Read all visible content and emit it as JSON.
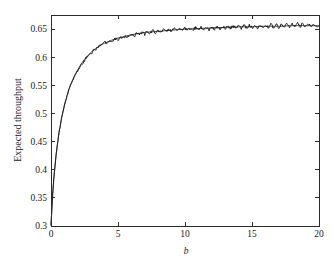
{
  "figure": {
    "background_color": "#ffffff",
    "axis_color": "#2b2b2b",
    "curve_color": "#111111"
  },
  "chart_data": {
    "type": "line",
    "title": "",
    "subtitle": "",
    "xlabel": "b",
    "ylabel": "Expected throughput",
    "xlim": [
      0,
      20
    ],
    "ylim": [
      0.3,
      0.675
    ],
    "grid": false,
    "legend": null,
    "legend_position": "none",
    "xticks": [
      0,
      5,
      10,
      15,
      20
    ],
    "xtick_labels": [
      "0",
      "5",
      "10",
      "15",
      "20"
    ],
    "yticks": [
      0.3,
      0.35,
      0.4,
      0.45,
      0.5,
      0.55,
      0.6,
      0.65
    ],
    "ytick_labels": [
      "0.3",
      "0.35",
      "0.4",
      "0.45",
      "0.5",
      "0.55",
      "0.6",
      "0.65"
    ],
    "annotations": [],
    "series": [
      {
        "name": "analytical",
        "style": "smooth-line",
        "x": [
          0,
          0.1,
          0.2,
          0.3,
          0.4,
          0.5,
          0.6,
          0.7,
          0.8,
          0.9,
          1.0,
          1.2,
          1.4,
          1.6,
          1.8,
          2.0,
          2.25,
          2.5,
          2.75,
          3.0,
          3.25,
          3.5,
          3.75,
          4.0,
          4.5,
          5.0,
          5.5,
          6.0,
          6.5,
          7.0,
          7.5,
          8.0,
          9.0,
          10.0,
          11.0,
          12.0,
          13.0,
          14.0,
          15.0,
          16.0,
          17.0,
          18.0,
          19.0,
          20.0
        ],
        "y": [
          0.301,
          0.347,
          0.381,
          0.408,
          0.43,
          0.449,
          0.466,
          0.48,
          0.493,
          0.504,
          0.514,
          0.532,
          0.547,
          0.559,
          0.569,
          0.578,
          0.588,
          0.596,
          0.603,
          0.609,
          0.614,
          0.618,
          0.622,
          0.625,
          0.63,
          0.634,
          0.637,
          0.64,
          0.642,
          0.644,
          0.645,
          0.646,
          0.648,
          0.65,
          0.651,
          0.652,
          0.653,
          0.654,
          0.654,
          0.655,
          0.655,
          0.656,
          0.656,
          0.656
        ]
      },
      {
        "name": "simulation",
        "style": "noisy-line",
        "x": [
          0,
          0.1,
          0.2,
          0.3,
          0.4,
          0.5,
          0.6,
          0.7,
          0.8,
          0.9,
          1.0,
          1.2,
          1.4,
          1.6,
          1.8,
          2.0,
          2.2,
          2.4,
          2.6,
          2.8,
          3.0,
          3.2,
          3.4,
          3.6,
          3.8,
          4.0,
          4.2,
          4.4,
          4.6,
          4.8,
          5.0,
          5.2,
          5.4,
          5.6,
          5.8,
          6.0,
          6.2,
          6.4,
          6.6,
          6.8,
          7.0,
          7.2,
          7.4,
          7.6,
          7.8,
          8.0,
          8.2,
          8.4,
          8.6,
          8.8,
          9.0,
          9.2,
          9.4,
          9.6,
          9.8,
          10.0,
          10.2,
          10.4,
          10.6,
          10.8,
          11.0,
          11.2,
          11.4,
          11.6,
          11.8,
          12.0,
          12.2,
          12.4,
          12.6,
          12.8,
          13.0,
          13.2,
          13.4,
          13.6,
          13.8,
          14.0,
          14.2,
          14.4,
          14.6,
          14.8,
          15.0,
          15.2,
          15.4,
          15.6,
          15.8,
          16.0,
          16.2,
          16.4,
          16.6,
          16.8,
          17.0,
          17.2,
          17.4,
          17.6,
          17.8,
          18.0,
          18.2,
          18.4,
          18.6,
          18.8,
          19.0,
          19.2,
          19.4,
          19.6,
          19.8,
          20.0
        ],
        "y": [
          0.302,
          0.346,
          0.382,
          0.407,
          0.431,
          0.448,
          0.467,
          0.479,
          0.494,
          0.503,
          0.515,
          0.531,
          0.548,
          0.558,
          0.57,
          0.576,
          0.585,
          0.59,
          0.598,
          0.604,
          0.607,
          0.613,
          0.615,
          0.62,
          0.621,
          0.626,
          0.625,
          0.629,
          0.628,
          0.633,
          0.631,
          0.635,
          0.633,
          0.638,
          0.635,
          0.641,
          0.637,
          0.643,
          0.639,
          0.644,
          0.641,
          0.646,
          0.642,
          0.647,
          0.643,
          0.648,
          0.644,
          0.649,
          0.645,
          0.65,
          0.646,
          0.651,
          0.647,
          0.651,
          0.647,
          0.652,
          0.648,
          0.652,
          0.648,
          0.653,
          0.648,
          0.653,
          0.649,
          0.654,
          0.649,
          0.654,
          0.65,
          0.655,
          0.65,
          0.655,
          0.65,
          0.655,
          0.651,
          0.656,
          0.651,
          0.656,
          0.651,
          0.657,
          0.652,
          0.657,
          0.652,
          0.657,
          0.652,
          0.658,
          0.652,
          0.658,
          0.653,
          0.658,
          0.653,
          0.659,
          0.653,
          0.659,
          0.653,
          0.659,
          0.654,
          0.66,
          0.654,
          0.66,
          0.654,
          0.66,
          0.654,
          0.66,
          0.655,
          0.66,
          0.655,
          0.656
        ]
      }
    ]
  }
}
